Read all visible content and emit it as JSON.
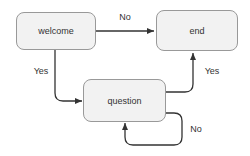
{
  "diagram": {
    "type": "flowchart",
    "nodes": [
      {
        "id": "welcome",
        "label": "welcome"
      },
      {
        "id": "end",
        "label": "end"
      },
      {
        "id": "question",
        "label": "question"
      }
    ],
    "edges": [
      {
        "from": "welcome",
        "to": "end",
        "label": "No"
      },
      {
        "from": "welcome",
        "to": "question",
        "label": "Yes"
      },
      {
        "from": "question",
        "to": "end",
        "label": "Yes"
      },
      {
        "from": "question",
        "to": "question",
        "label": "No"
      }
    ],
    "colors": {
      "background": "#ffffff",
      "node_fill": "#f2f2f2",
      "node_border": "#999999",
      "line": "#333333",
      "text": "#333333"
    }
  }
}
